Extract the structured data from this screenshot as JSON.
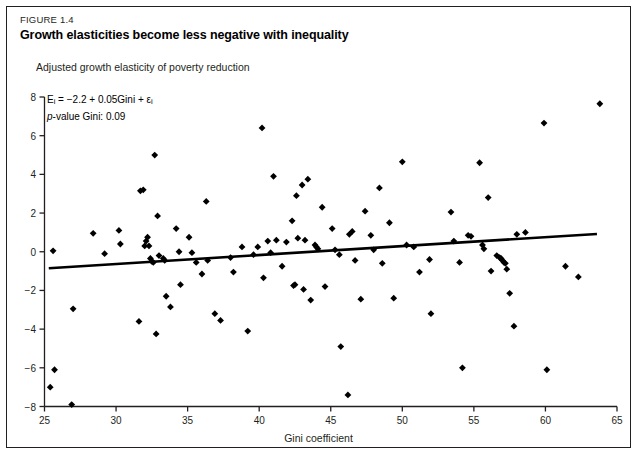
{
  "figure": {
    "number": "FIGURE 1.4",
    "title": "Growth elasticities become less negative with inequality",
    "y_axis_title": "Adjusted growth elasticity of poverty reduction",
    "x_axis_title": "Gini coefficient",
    "equation_line1": "Eᵢ = −2.2 + 0.05Gini + εᵢ",
    "equation_line2": "p-value Gini: 0.09",
    "marker_color": "#000000",
    "line_color": "#000000",
    "frame_color": "#231f20"
  },
  "chart_data": {
    "type": "scatter",
    "title": "Growth elasticities become less negative with inequality",
    "subtitle": "FIGURE 1.4",
    "xlabel": "Gini coefficient",
    "ylabel": "Adjusted growth elasticity of poverty reduction",
    "xlim": [
      25,
      65
    ],
    "ylim": [
      -8,
      8
    ],
    "xticks": [
      25,
      30,
      35,
      40,
      45,
      50,
      55,
      60,
      65
    ],
    "yticks": [
      -8,
      -6,
      -4,
      -2,
      0,
      2,
      4,
      6,
      8
    ],
    "grid": false,
    "legend": "none",
    "annotations": [
      "Eᵢ = −2.2 + 0.05Gini + εᵢ",
      "p-value Gini: 0.09"
    ],
    "regression": {
      "intercept": -2.2,
      "slope": 0.05,
      "p_value": 0.09,
      "x_start": 25.3,
      "y_start": -0.85,
      "x_end": 63.6,
      "y_end": 0.92
    },
    "points": [
      [
        25.4,
        -7.0
      ],
      [
        25.6,
        0.05
      ],
      [
        25.7,
        -6.1
      ],
      [
        26.9,
        -7.9
      ],
      [
        27.0,
        -2.95
      ],
      [
        28.4,
        0.95
      ],
      [
        29.2,
        -0.1
      ],
      [
        30.2,
        1.1
      ],
      [
        30.3,
        0.4
      ],
      [
        31.6,
        -3.6
      ],
      [
        31.7,
        3.15
      ],
      [
        31.9,
        3.2
      ],
      [
        32.0,
        0.3
      ],
      [
        32.1,
        0.55
      ],
      [
        32.2,
        0.75
      ],
      [
        32.3,
        0.3
      ],
      [
        32.4,
        -0.35
      ],
      [
        32.5,
        -0.5
      ],
      [
        32.6,
        -0.55
      ],
      [
        32.7,
        5.0
      ],
      [
        32.8,
        -4.25
      ],
      [
        32.9,
        1.85
      ],
      [
        33.0,
        -0.2
      ],
      [
        33.3,
        -0.35
      ],
      [
        33.4,
        -0.45
      ],
      [
        33.5,
        -2.3
      ],
      [
        33.8,
        -2.85
      ],
      [
        34.2,
        1.2
      ],
      [
        34.4,
        0.0
      ],
      [
        34.5,
        -1.7
      ],
      [
        35.1,
        0.75
      ],
      [
        35.3,
        -0.05
      ],
      [
        35.6,
        -0.55
      ],
      [
        36.0,
        -1.15
      ],
      [
        36.3,
        2.6
      ],
      [
        36.4,
        -0.45
      ],
      [
        36.9,
        -3.2
      ],
      [
        37.3,
        -3.55
      ],
      [
        38.0,
        -0.3
      ],
      [
        38.2,
        -1.05
      ],
      [
        38.8,
        0.25
      ],
      [
        39.2,
        -4.1
      ],
      [
        39.6,
        -0.15
      ],
      [
        39.9,
        0.25
      ],
      [
        40.2,
        6.4
      ],
      [
        40.3,
        -1.35
      ],
      [
        40.6,
        0.55
      ],
      [
        40.8,
        -0.05
      ],
      [
        41.0,
        3.9
      ],
      [
        41.2,
        0.6
      ],
      [
        41.6,
        -0.75
      ],
      [
        41.9,
        0.5
      ],
      [
        42.3,
        1.6
      ],
      [
        42.4,
        -1.75
      ],
      [
        42.5,
        -1.7
      ],
      [
        42.6,
        2.9
      ],
      [
        42.7,
        0.7
      ],
      [
        43.0,
        3.45
      ],
      [
        43.1,
        -1.95
      ],
      [
        43.2,
        0.6
      ],
      [
        43.4,
        3.75
      ],
      [
        43.6,
        -2.5
      ],
      [
        43.9,
        0.35
      ],
      [
        44.0,
        0.25
      ],
      [
        44.1,
        0.15
      ],
      [
        44.4,
        2.3
      ],
      [
        44.6,
        -1.8
      ],
      [
        45.1,
        1.2
      ],
      [
        45.3,
        0.1
      ],
      [
        45.6,
        -0.15
      ],
      [
        45.7,
        -4.9
      ],
      [
        46.2,
        -7.4
      ],
      [
        46.3,
        0.9
      ],
      [
        46.5,
        1.05
      ],
      [
        46.7,
        -0.45
      ],
      [
        47.1,
        -2.45
      ],
      [
        47.4,
        2.1
      ],
      [
        47.8,
        0.85
      ],
      [
        48.0,
        0.1
      ],
      [
        48.4,
        3.3
      ],
      [
        48.6,
        -0.6
      ],
      [
        49.1,
        1.5
      ],
      [
        49.4,
        -2.4
      ],
      [
        50.0,
        4.65
      ],
      [
        50.3,
        0.35
      ],
      [
        50.8,
        0.25
      ],
      [
        51.2,
        -1.05
      ],
      [
        51.9,
        -0.4
      ],
      [
        52.0,
        -3.2
      ],
      [
        53.4,
        2.05
      ],
      [
        53.6,
        0.55
      ],
      [
        54.0,
        -0.55
      ],
      [
        54.2,
        -6.0
      ],
      [
        54.6,
        0.85
      ],
      [
        54.8,
        0.8
      ],
      [
        55.4,
        4.6
      ],
      [
        55.6,
        0.35
      ],
      [
        55.7,
        0.15
      ],
      [
        56.0,
        2.8
      ],
      [
        56.2,
        -1.0
      ],
      [
        56.6,
        -0.2
      ],
      [
        56.8,
        -0.3
      ],
      [
        56.9,
        -0.35
      ],
      [
        57.0,
        -0.45
      ],
      [
        57.1,
        -0.55
      ],
      [
        57.2,
        -0.6
      ],
      [
        57.3,
        -0.9
      ],
      [
        57.5,
        -2.15
      ],
      [
        57.8,
        -3.85
      ],
      [
        58.0,
        0.9
      ],
      [
        58.6,
        1.0
      ],
      [
        59.9,
        6.65
      ],
      [
        60.1,
        -6.1
      ],
      [
        61.4,
        -0.75
      ],
      [
        62.3,
        -1.3
      ],
      [
        63.8,
        7.65
      ]
    ]
  }
}
